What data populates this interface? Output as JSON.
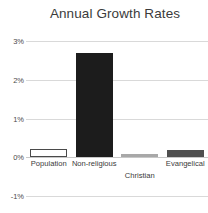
{
  "chart_data": {
    "type": "bar",
    "title": "Annual Growth Rates",
    "xlabel": "",
    "ylabel": "",
    "categories": [
      "Population",
      "Non-religious",
      "Christian",
      "Evangelical"
    ],
    "values": [
      0.22,
      2.7,
      0.08,
      0.2
    ],
    "value_labels": [
      "0.22%",
      "2.70%",
      "0.08%",
      "0.20%"
    ],
    "ylim": [
      -1,
      3
    ],
    "yticks": [
      3,
      2,
      1,
      0,
      -1
    ],
    "ytick_labels": [
      "3%",
      "2%",
      "1%",
      "0%",
      "-1%"
    ],
    "grid": true,
    "legend": "none",
    "bar_styles": [
      "outline",
      "dark",
      "light",
      "mid"
    ],
    "bar_colors": [
      "#ffffff",
      "#1c1c1c",
      "#a8a8a8",
      "#4f4f4f"
    ],
    "bar_border_color": "#4a4a4a",
    "gridline_color": "#d9d9d9",
    "zero_line_color": "#c8c8c8",
    "title_color": "#3b3b3b",
    "tick_color": "#4a4a4a",
    "background_color": "#ffffff",
    "label_rows": [
      0,
      0,
      1,
      0
    ]
  }
}
